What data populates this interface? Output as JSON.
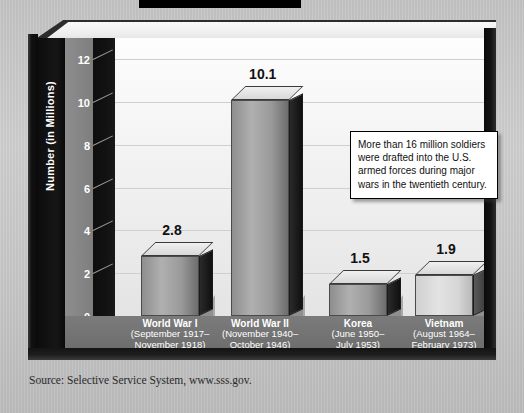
{
  "source_note": "Source: Selective Service System, www.sss.gov.",
  "callout": {
    "text": "More than 16 million soldiers were drafted into the U.S. armed forces during major wars in the twentieth century."
  },
  "axis": {
    "y_title": "Number (in Millions)"
  },
  "chart_data": {
    "type": "bar",
    "title": "",
    "xlabel": "",
    "ylabel": "Number (in Millions)",
    "ylim": [
      0,
      13
    ],
    "yticks": [
      0,
      2,
      4,
      6,
      8,
      10,
      12
    ],
    "ytick_labels": [
      "0",
      "2",
      "4",
      "6",
      "8",
      "10",
      "12"
    ],
    "grid": true,
    "legend": "none",
    "units": "millions of soldiers drafted",
    "categories": [
      "World War I",
      "World War II",
      "Korea",
      "Vietnam"
    ],
    "category_sublabels": [
      "(September 1917–\nNovember 1918)",
      "(November 1940–\nOctober 1946)",
      "(June 1950–\nJuly 1953)",
      "(August 1964–\nFebruary 1973)"
    ],
    "values": [
      2.8,
      10.1,
      1.5,
      1.9
    ],
    "data_labels": [
      "2.8",
      "10.1",
      "1.5",
      "1.9"
    ],
    "bars": [
      {
        "name": "World War I",
        "line1": "World War I",
        "line2": "(September 1917–",
        "line3": "November 1918)",
        "value": 2.8,
        "label": "2.8",
        "shade": "dark"
      },
      {
        "name": "World War II",
        "line1": "World War II",
        "line2": "(November 1940–",
        "line3": "October 1946)",
        "value": 10.1,
        "label": "10.1",
        "shade": "dark"
      },
      {
        "name": "Korea",
        "line1": "Korea",
        "line2": "(June 1950–",
        "line3": "July 1953)",
        "value": 1.5,
        "label": "1.5",
        "shade": "dark"
      },
      {
        "name": "Vietnam",
        "line1": "Vietnam",
        "line2": "(August 1964–",
        "line3": "February 1973)",
        "value": 1.9,
        "label": "1.9",
        "shade": "light"
      }
    ]
  },
  "colors": {
    "page_background": "#c8c8c8",
    "frame": "#101010",
    "plot_background": "#f4f4f4",
    "floor": "#727272",
    "gridline": "#cfcfcf",
    "bar_dark": "#9a9a9a",
    "bar_light": "#d8d8d8",
    "label_text": "#ffffff",
    "value_text": "#111111"
  }
}
